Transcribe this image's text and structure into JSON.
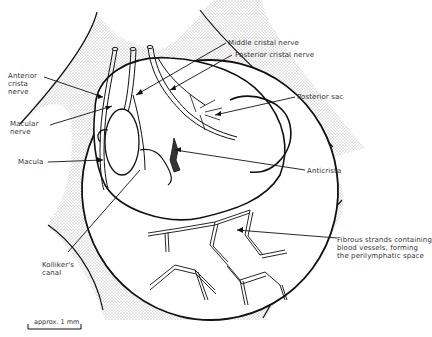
{
  "figure": {
    "type": "anatomical-diagram",
    "colors": {
      "stroke": "#111111",
      "stipple": "#cfcfcf",
      "background": "#ffffff"
    }
  },
  "labels": {
    "anterior_crista_nerve": "Anterior\ncrista\nnerve",
    "macular_nerve": "Macular\nnerve",
    "macula": "Macula",
    "middle_cristal_nerve": "Middle cristal nerve",
    "posterior_cristal_nerve": "Posterior cristal nerve",
    "posterior_sac": "Posterior sac",
    "anticrista": "Anticrista",
    "kollikers_canal": "Kolliker's\ncanal",
    "fibrous_strands": "Fibrous strands containing\nblood vessels, forming\nthe perilymphatic space"
  },
  "scale_bar": {
    "label": "approx. 1 mm"
  }
}
